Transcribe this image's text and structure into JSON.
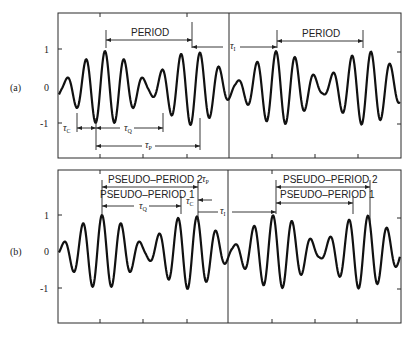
{
  "panels": [
    {
      "id": "a",
      "label": "(a)",
      "y_ticks": [
        "1",
        "0",
        "-1"
      ],
      "annotations": {
        "period_left": "PERIOD",
        "period_right": "PERIOD",
        "tau_c": "τ",
        "tau_c_sub": "C",
        "tau_q": "τ",
        "tau_q_sub": "Q",
        "tau_p": "τ",
        "tau_p_sub": "P",
        "tau_i": "τ",
        "tau_i_sub": "I"
      }
    },
    {
      "id": "b",
      "label": "(b)",
      "y_ticks": [
        "1",
        "0",
        "-1"
      ],
      "annotations": {
        "pseudo2_left": "PSEUDO–PERIOD 2",
        "pseudo1_left": "PSEUDO–PERIOD 1",
        "pseudo2_right": "PSEUDO–PERIOD 2",
        "pseudo1_right": "PSEUDO–PERIOD 1",
        "tau_q": "τ",
        "tau_q_sub": "Q",
        "tau_c": "τ",
        "tau_c_sub": "C",
        "tau_p": "τ",
        "tau_p_sub": "P",
        "tau_i": "τ",
        "tau_i_sub": "I"
      }
    }
  ],
  "wave": {
    "carrier_period_px": 19,
    "envelope_period_px": 87,
    "line_color": "#111111"
  }
}
